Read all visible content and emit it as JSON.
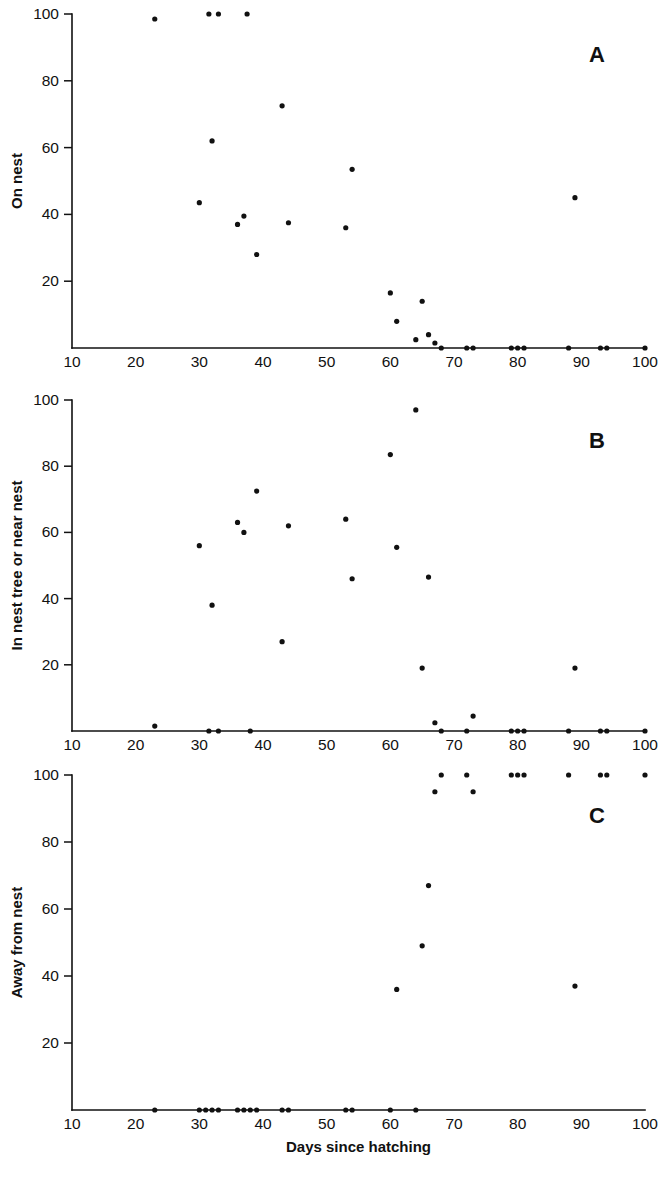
{
  "figure": {
    "background": "#ffffff",
    "ink_color": "#111111",
    "width": 667,
    "height": 1186,
    "xlabel": "Days since hatching"
  },
  "axis": {
    "x_ticks": [
      10,
      20,
      30,
      40,
      50,
      60,
      70,
      80,
      90,
      100
    ],
    "x_tick_labels": [
      "10",
      "20",
      "30",
      "40",
      "50",
      "60",
      "70",
      "80",
      "90",
      "100"
    ],
    "y_ticks": [
      20,
      40,
      60,
      80,
      100
    ],
    "y_tick_labels": [
      "20",
      "40",
      "60",
      "80",
      "100"
    ],
    "xlim": [
      10,
      100
    ],
    "ylim": [
      0,
      100
    ]
  },
  "chart_data": [
    {
      "type": "scatter",
      "panel": "A",
      "panel_label": "A",
      "title": "",
      "xlabel": "",
      "ylabel": "On nest",
      "xlim": [
        10,
        100
      ],
      "ylim": [
        0,
        100
      ],
      "grid": false,
      "legend": "none",
      "points": [
        [
          23,
          98.5
        ],
        [
          31.5,
          100
        ],
        [
          33,
          100
        ],
        [
          37.5,
          100
        ],
        [
          30,
          43.5
        ],
        [
          32,
          62
        ],
        [
          36,
          37
        ],
        [
          37,
          39.5
        ],
        [
          39,
          28
        ],
        [
          43,
          72.5
        ],
        [
          44,
          37.5
        ],
        [
          53,
          36
        ],
        [
          54,
          53.5
        ],
        [
          60,
          16.5
        ],
        [
          61,
          8
        ],
        [
          64,
          2.5
        ],
        [
          65,
          14
        ],
        [
          66,
          4
        ],
        [
          67,
          1.5
        ],
        [
          68,
          0
        ],
        [
          72,
          0
        ],
        [
          73,
          0
        ],
        [
          79,
          0
        ],
        [
          80,
          0
        ],
        [
          81,
          0
        ],
        [
          88,
          0
        ],
        [
          89,
          45
        ],
        [
          93,
          0
        ],
        [
          94,
          0
        ],
        [
          100,
          0
        ]
      ]
    },
    {
      "type": "scatter",
      "panel": "B",
      "panel_label": "B",
      "title": "",
      "xlabel": "",
      "ylabel": "In nest tree or near nest",
      "xlim": [
        10,
        100
      ],
      "ylim": [
        0,
        100
      ],
      "grid": false,
      "legend": "none",
      "points": [
        [
          23,
          1.5
        ],
        [
          30,
          56
        ],
        [
          31.5,
          0
        ],
        [
          32,
          38
        ],
        [
          33,
          0
        ],
        [
          36,
          63
        ],
        [
          37,
          60
        ],
        [
          38,
          0
        ],
        [
          39,
          72.5
        ],
        [
          43,
          27
        ],
        [
          44,
          62
        ],
        [
          53,
          64
        ],
        [
          54,
          46
        ],
        [
          60,
          83.5
        ],
        [
          61,
          55.5
        ],
        [
          64,
          97
        ],
        [
          65,
          19
        ],
        [
          66,
          46.5
        ],
        [
          67,
          2.5
        ],
        [
          68,
          0
        ],
        [
          72,
          0
        ],
        [
          73,
          4.5
        ],
        [
          79,
          0
        ],
        [
          80,
          0
        ],
        [
          81,
          0
        ],
        [
          88,
          0
        ],
        [
          89,
          19
        ],
        [
          93,
          0
        ],
        [
          94,
          0
        ],
        [
          100,
          0
        ]
      ]
    },
    {
      "type": "scatter",
      "panel": "C",
      "panel_label": "C",
      "title": "",
      "xlabel": "Days since hatching",
      "ylabel": "Away from nest",
      "xlim": [
        10,
        100
      ],
      "ylim": [
        0,
        100
      ],
      "grid": false,
      "legend": "none",
      "points": [
        [
          23,
          0
        ],
        [
          30,
          0
        ],
        [
          31,
          0
        ],
        [
          32,
          0
        ],
        [
          33,
          0
        ],
        [
          36,
          0
        ],
        [
          37,
          0
        ],
        [
          38,
          0
        ],
        [
          39,
          0
        ],
        [
          43,
          0
        ],
        [
          44,
          0
        ],
        [
          53,
          0
        ],
        [
          54,
          0
        ],
        [
          60,
          0
        ],
        [
          61,
          36
        ],
        [
          64,
          0
        ],
        [
          65,
          49
        ],
        [
          66,
          67
        ],
        [
          67,
          95
        ],
        [
          68,
          100
        ],
        [
          72,
          100
        ],
        [
          73,
          95
        ],
        [
          79,
          100
        ],
        [
          80,
          100
        ],
        [
          81,
          100
        ],
        [
          88,
          100
        ],
        [
          89,
          37
        ],
        [
          93,
          100
        ],
        [
          94,
          100
        ],
        [
          100,
          100
        ]
      ]
    }
  ]
}
